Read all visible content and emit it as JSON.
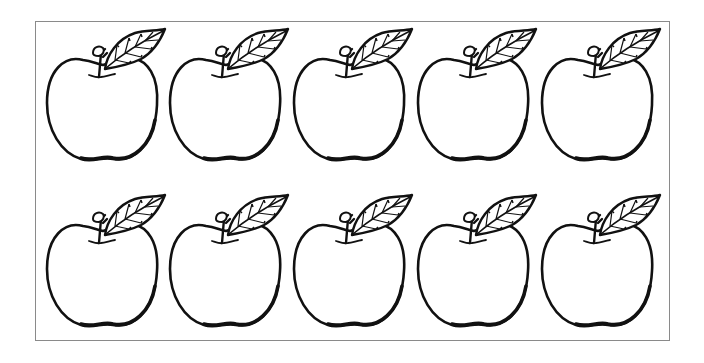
{
  "worksheet": {
    "title": "Apples",
    "layout": {
      "rows": 2,
      "columns": 5
    },
    "stroke_color": "#111111",
    "fill_color": "#ffffff",
    "border_color": "#8a8a8a",
    "apples": [
      {
        "row": 1,
        "col": 1,
        "label": "apple"
      },
      {
        "row": 1,
        "col": 2,
        "label": "apple"
      },
      {
        "row": 1,
        "col": 3,
        "label": "apple"
      },
      {
        "row": 1,
        "col": 4,
        "label": "apple"
      },
      {
        "row": 1,
        "col": 5,
        "label": "apple"
      },
      {
        "row": 2,
        "col": 1,
        "label": "apple"
      },
      {
        "row": 2,
        "col": 2,
        "label": "apple"
      },
      {
        "row": 2,
        "col": 3,
        "label": "apple"
      },
      {
        "row": 2,
        "col": 4,
        "label": "apple"
      },
      {
        "row": 2,
        "col": 5,
        "label": "apple"
      }
    ]
  }
}
